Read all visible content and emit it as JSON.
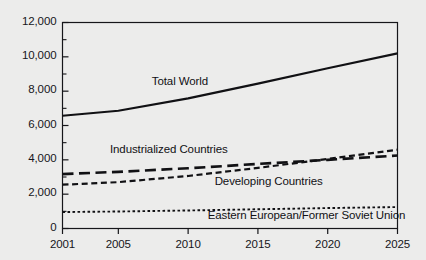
{
  "chart_data": {
    "type": "line",
    "title": "",
    "subtitle": "",
    "xlabel": "",
    "ylabel": "",
    "x": [
      2001,
      2005,
      2010,
      2015,
      2020,
      2025
    ],
    "xlim": [
      2001,
      2025
    ],
    "ylim": [
      0,
      12000
    ],
    "grid": false,
    "legend_position": "inline-annotations",
    "x_ticks": [
      "2001",
      "2005",
      "2010",
      "2015",
      "2020",
      "2025"
    ],
    "y_ticks": [
      "0",
      "2,000",
      "4,000",
      "6,000",
      "8,000",
      "10,000",
      "12,000"
    ],
    "y_tick_values": [
      0,
      2000,
      4000,
      6000,
      8000,
      10000,
      12000
    ],
    "y_minor_tick_values": [
      1000,
      3000,
      5000,
      7000,
      9000,
      11000
    ],
    "series": [
      {
        "name": "Total World",
        "style": "solid",
        "color": "#111114",
        "values": [
          6570,
          6860,
          7580,
          8440,
          9340,
          10200
        ],
        "label_x": 2007.4,
        "label_y": 8480
      },
      {
        "name": "Industrialized Countries",
        "style": "long-dash",
        "color": "#111114",
        "values": [
          3170,
          3300,
          3510,
          3760,
          4000,
          4250
        ],
        "label_x": 2004.4,
        "label_y": 4530
      },
      {
        "name": "Developing Countries",
        "style": "medium-dash",
        "color": "#111114",
        "values": [
          2550,
          2700,
          3060,
          3530,
          4050,
          4590
        ],
        "label_x": 2011.9,
        "label_y": 2630
      },
      {
        "name": "Eastern European/Former Soviet Union",
        "style": "dotted",
        "color": "#111114",
        "values": [
          960,
          990,
          1050,
          1120,
          1190,
          1250
        ],
        "label_x": 2011.4,
        "label_y": 660
      }
    ]
  }
}
